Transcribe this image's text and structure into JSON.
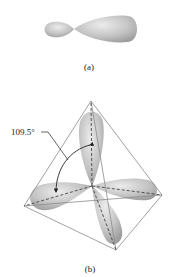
{
  "figure_a": {
    "caption": "(a)",
    "description": "single sp3 hybrid orbital with small and large lobe"
  },
  "figure_b": {
    "caption": "(b)",
    "angle_label": "109.5°",
    "description": "four sp3 hybrid orbitals directed to corners of a tetrahedron"
  },
  "colors": {
    "lobe_fill": "#b8b8b8",
    "lobe_highlight": "#e4e4e4",
    "edge": "#8a8a8a",
    "axis": "#333333",
    "text": "#222222"
  }
}
